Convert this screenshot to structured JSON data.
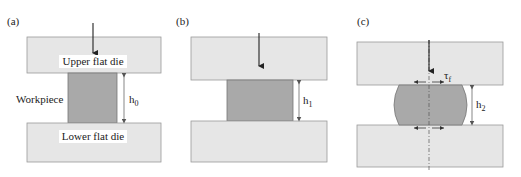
{
  "figure": {
    "panels": [
      {
        "id": "a",
        "label": "(a)",
        "upper_die_label": "Upper flat die",
        "lower_die_label": "Lower flat die",
        "workpiece_label": "Workpiece",
        "height_label": "h",
        "height_subscript": "0"
      },
      {
        "id": "b",
        "label": "(b)",
        "height_label": "h",
        "height_subscript": "1"
      },
      {
        "id": "c",
        "label": "(c)",
        "height_label": "h",
        "height_subscript": "2",
        "friction_label": "τ",
        "friction_subscript": "f"
      }
    ],
    "colors": {
      "die_fill": "#e6e6e6",
      "workpiece_fill": "#a9a9a9",
      "line": "#222222"
    }
  }
}
